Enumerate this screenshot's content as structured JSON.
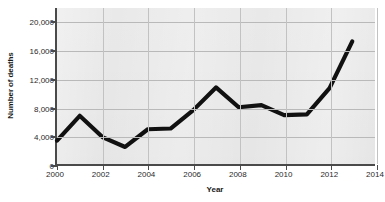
{
  "chart_data": {
    "type": "line",
    "title": "",
    "xlabel": "Year",
    "ylabel": "Number of deaths",
    "xlim": [
      2000,
      2014
    ],
    "ylim": [
      0,
      22000
    ],
    "grid": true,
    "legend": "none",
    "xticks": [
      "2000",
      "2002",
      "2004",
      "2006",
      "2008",
      "2010",
      "2012",
      "2014"
    ],
    "xtick_values": [
      2000,
      2002,
      2004,
      2006,
      2008,
      2010,
      2012,
      2014
    ],
    "yticks": [
      "0",
      "4,000",
      "8,000",
      "12,000",
      "16,000",
      "20,000"
    ],
    "ytick_values": [
      0,
      4000,
      8000,
      12000,
      16000,
      20000
    ],
    "x": [
      2000,
      2001,
      2002,
      2003,
      2004,
      2005,
      2006,
      2007,
      2008,
      2009,
      2010,
      2011,
      2012,
      2013
    ],
    "series": [
      {
        "name": "Number of deaths",
        "color": "#111111",
        "values": [
          3300,
          6800,
          3800,
          2400,
          4900,
          5000,
          7600,
          10800,
          8000,
          8300,
          6900,
          7000,
          10700,
          17300
        ]
      }
    ]
  }
}
